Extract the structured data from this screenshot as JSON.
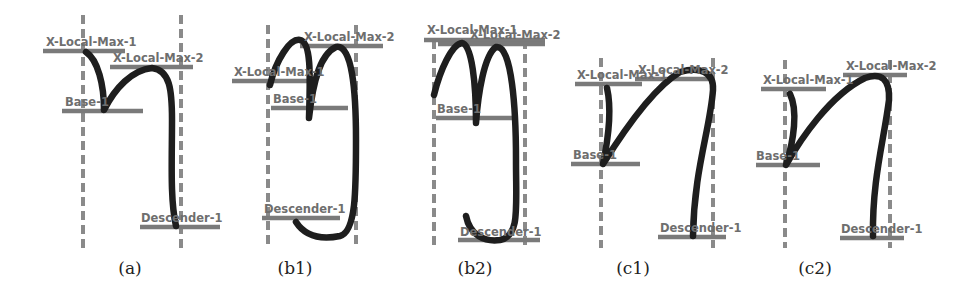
{
  "figure": {
    "panels": [
      {
        "id": "a",
        "caption": "(a)",
        "labels": {
          "max1": "X-Local-Max-1",
          "max2": "X-Local-Max-2",
          "base": "Base-1",
          "descender": "Descender-1"
        }
      },
      {
        "id": "b1",
        "caption": "(b1)",
        "labels": {
          "max1": "X-Local-Max-1",
          "max2": "X-Local-Max-2",
          "base": "Base-1",
          "descender": "Descender-1"
        }
      },
      {
        "id": "b2",
        "caption": "(b2)",
        "labels": {
          "max1": "X-Local-Max-1",
          "max2": "X-Local-Max-2",
          "base": "Base-1",
          "descender": "Descender-1"
        }
      },
      {
        "id": "c1",
        "caption": "(c1)",
        "labels": {
          "max1": "X-Local-Max-1",
          "max2": "X-Local-Max-2",
          "base": "Base-1",
          "descender": "Descender-1"
        }
      },
      {
        "id": "c2",
        "caption": "(c2)",
        "labels": {
          "max1": "X-Local-Max-1",
          "max2": "X-Local-Max-2",
          "base": "Base-1",
          "descender": "Descender-1"
        }
      }
    ]
  },
  "colors": {
    "stroke": "#1e1e1e",
    "guide": "#8a8a8a",
    "label": "#6e6e6e",
    "background": "#ffffff"
  }
}
